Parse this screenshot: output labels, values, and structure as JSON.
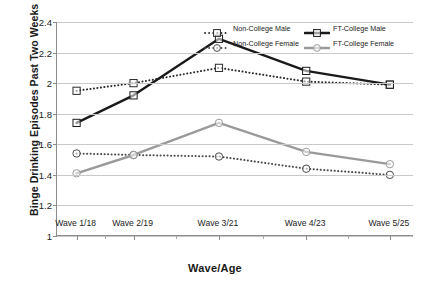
{
  "chart_data": {
    "type": "line",
    "title": "",
    "xlabel": "Wave/Age",
    "ylabel": "Binge Drinking Episodes Past Two Weeks",
    "categories": [
      "Wave 1/18",
      "Wave 2/19",
      "Wave 3/21",
      "Wave 4/23",
      "Wave 5/25"
    ],
    "ylim": [
      1,
      2.4
    ],
    "ytick_labels": [
      "1",
      "1.2",
      "1.4",
      "1.6",
      "1.8",
      "2",
      "2.2",
      "2.4"
    ],
    "ytick_values": [
      1,
      1.2,
      1.4,
      1.6,
      1.8,
      2,
      2.2,
      2.4
    ],
    "grid": true,
    "legend_position": "top-right",
    "series": [
      {
        "name": "Non-College Male",
        "values": [
          1.95,
          2.0,
          2.1,
          2.01,
          1.99
        ],
        "style": "dotted",
        "marker": "square",
        "color": "#2b2b2b"
      },
      {
        "name": "FT-College Male",
        "values": [
          1.74,
          1.92,
          2.29,
          2.08,
          1.99
        ],
        "style": "solid",
        "marker": "square",
        "color": "#1a1a1a"
      },
      {
        "name": "Non-College Female",
        "values": [
          1.54,
          1.53,
          1.52,
          1.44,
          1.4
        ],
        "style": "dotted",
        "marker": "circle",
        "color": "#4a4a4a"
      },
      {
        "name": "FT-College Female",
        "values": [
          1.41,
          1.53,
          1.74,
          1.55,
          1.47
        ],
        "style": "solid",
        "marker": "circle",
        "color": "#9a9a9a"
      }
    ]
  },
  "legend": {
    "entries": [
      {
        "label": "Non-College Male"
      },
      {
        "label": "FT-College Male"
      },
      {
        "label": "Non-College Female"
      },
      {
        "label": "FT-College Female"
      }
    ]
  }
}
